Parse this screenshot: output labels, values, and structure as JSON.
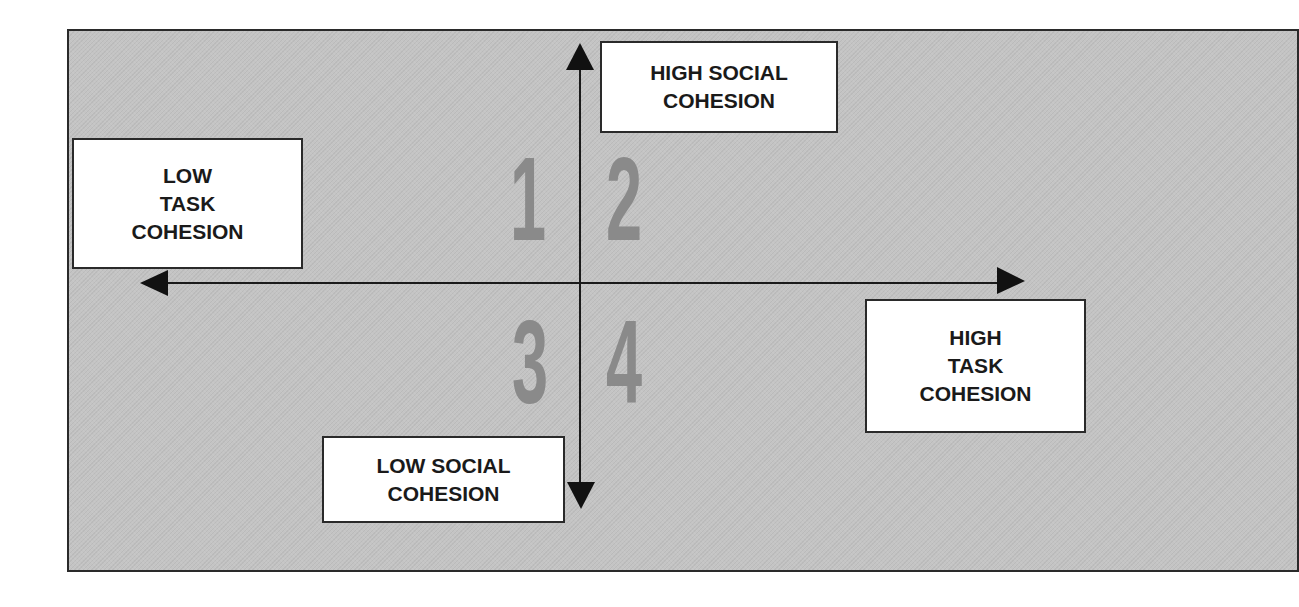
{
  "diagram": {
    "type": "quadrant-matrix",
    "axes": {
      "horizontal": {
        "left_label": "LOW\nTASK\nCOHESION",
        "right_label": "HIGH\nTASK\nCOHESION"
      },
      "vertical": {
        "top_label": "HIGH SOCIAL\nCOHESION",
        "bottom_label": "LOW SOCIAL\nCOHESION"
      }
    },
    "quadrants": [
      {
        "number": "1",
        "position": "top-left"
      },
      {
        "number": "2",
        "position": "top-right"
      },
      {
        "number": "3",
        "position": "bottom-left"
      },
      {
        "number": "4",
        "position": "bottom-right"
      }
    ],
    "colors": {
      "panel_background": "#c4c4c4",
      "quadrant_number": "#8a8a8a",
      "lines": "#1a1a1a",
      "label_box": "#ffffff"
    }
  }
}
